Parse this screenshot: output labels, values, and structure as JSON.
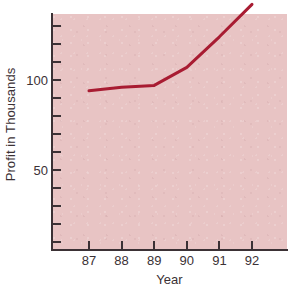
{
  "chart_data": {
    "type": "line",
    "title": "",
    "xlabel": "Year",
    "ylabel": "Profit in Thousands",
    "x": [
      "87",
      "88",
      "89",
      "90",
      "91",
      "92"
    ],
    "categories": [
      "87",
      "88",
      "89",
      "90",
      "91",
      "92"
    ],
    "values": [
      94,
      96,
      97,
      107,
      124,
      142
    ],
    "series": [
      {
        "name": "Profit",
        "values": [
          94,
          96,
          97,
          107,
          124,
          142
        ]
      }
    ],
    "xlim": [
      86.5,
      92.5
    ],
    "ylim": [
      0,
      132
    ],
    "x_tick_labels": [
      "87",
      "88",
      "89",
      "90",
      "91",
      "92"
    ],
    "y_tick_labels": [
      "100",
      "50"
    ],
    "y_labeled_ticks": [
      100,
      50
    ],
    "y_tick_values": [
      130,
      120,
      110,
      100,
      90,
      80,
      70,
      60,
      50,
      40,
      30,
      20,
      10
    ],
    "y_tick_interval": 10,
    "grid": false,
    "legend": null,
    "legend_position": "none",
    "annotations": []
  },
  "axes": {
    "y": {
      "title": "Profit in Thousands",
      "labels": [
        {
          "text": "100",
          "value": 100
        },
        {
          "text": "50",
          "value": 50
        }
      ]
    },
    "x": {
      "title": "Year",
      "labels": [
        {
          "text": "87",
          "value": 87
        },
        {
          "text": "88",
          "value": 88
        },
        {
          "text": "89",
          "value": 89
        },
        {
          "text": "90",
          "value": 90
        },
        {
          "text": "91",
          "value": 91
        },
        {
          "text": "92",
          "value": 92
        }
      ]
    }
  },
  "style": {
    "plot_background": "#e8c4c4",
    "page_background": "#ffffff",
    "line_color": "#a81c32",
    "axis_color": "#3b3135",
    "text_color": "#3b3135",
    "line_width_px": 3
  }
}
